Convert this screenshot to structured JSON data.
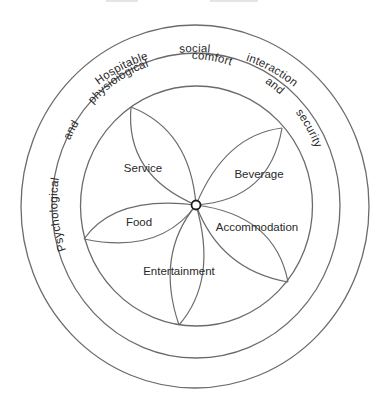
{
  "diagram": {
    "type": "concentric-rings-with-petals",
    "center_node": "hub",
    "outer_band": {
      "words": [
        "Hospitable",
        "social",
        "interaction"
      ],
      "text": "Hospitable social interaction"
    },
    "middle_band": {
      "words": [
        "Psychological",
        "and",
        "physioiogical",
        "comfort",
        "and",
        "security"
      ],
      "text": "Psychological and physioiogical comfort and security"
    },
    "petals": [
      {
        "label": "Service"
      },
      {
        "label": "Beverage"
      },
      {
        "label": "Accommodation"
      },
      {
        "label": "Entertainment"
      },
      {
        "label": "Food"
      }
    ],
    "colors": {
      "line": "#6b6b6b",
      "text": "#2a2a2a",
      "hub_stroke": "#1e1e1e",
      "background": "#ffffff"
    }
  }
}
